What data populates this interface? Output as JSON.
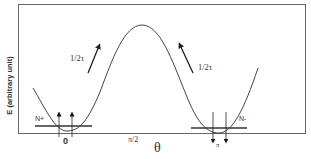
{
  "figure": {
    "y_axis_label": "E (arbitrary unit)",
    "x_axis_label": "θ",
    "x_ticks": [
      {
        "label": "0",
        "x": 66
      },
      {
        "label": "π/2",
        "x": 134
      },
      {
        "label": "π",
        "x": 219
      }
    ],
    "states": [
      {
        "name": "N+",
        "spin": "up",
        "position": "θ = 0"
      },
      {
        "name": "N-",
        "spin": "down",
        "position": "θ = π"
      }
    ],
    "transitions": [
      {
        "label": "1/2τ",
        "direction": "up-right",
        "side": "left"
      },
      {
        "label": "1/2τ",
        "direction": "up-left",
        "side": "right"
      }
    ],
    "colors": {
      "line": "#333333",
      "frame": "#555555",
      "background": "#ffffff"
    }
  }
}
